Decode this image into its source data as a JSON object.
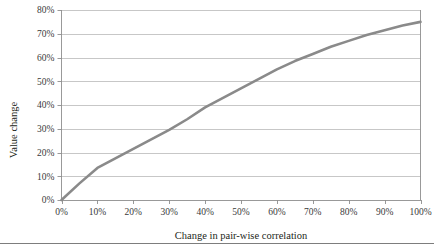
{
  "chart_data": {
    "type": "line",
    "title": "",
    "xlabel": "Change in pair-wise correlation",
    "ylabel": "Value change",
    "xlim": [
      0,
      100
    ],
    "ylim": [
      0,
      80
    ],
    "grid": true,
    "legend": null,
    "x_tick_labels": [
      "0%",
      "10%",
      "20%",
      "30%",
      "40%",
      "50%",
      "60%",
      "70%",
      "80%",
      "90%",
      "100%"
    ],
    "y_tick_labels": [
      "0%",
      "10%",
      "20%",
      "30%",
      "40%",
      "50%",
      "60%",
      "70%",
      "80%"
    ],
    "x_ticks": [
      0,
      10,
      20,
      30,
      40,
      50,
      60,
      70,
      80,
      90,
      100
    ],
    "y_ticks": [
      0,
      10,
      20,
      30,
      40,
      50,
      60,
      70,
      80
    ],
    "series": [
      {
        "name": "Value change",
        "color": "#8a8a8a",
        "x": [
          0,
          5,
          10,
          15,
          20,
          25,
          30,
          35,
          40,
          45,
          50,
          55,
          60,
          65,
          70,
          75,
          80,
          85,
          90,
          95,
          100
        ],
        "values": [
          0,
          7,
          13.5,
          17.5,
          21.5,
          25.5,
          29.5,
          34,
          39,
          43,
          47,
          51,
          55,
          58.5,
          61.5,
          64.5,
          67,
          69.5,
          71.5,
          73.5,
          75
        ]
      }
    ]
  },
  "labels": {
    "y_axis_title": "Value change",
    "x_axis_title": "Change in pair-wise correlation"
  }
}
